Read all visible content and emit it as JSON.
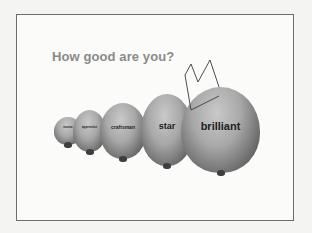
{
  "slide": {
    "title": "How good are you?",
    "levels": [
      {
        "label": "novice"
      },
      {
        "label": "apprentice"
      },
      {
        "label": "craftsman"
      },
      {
        "label": "star"
      },
      {
        "label": "brilliant"
      }
    ],
    "crown_on": "brilliant"
  },
  "colors": {
    "title": "#8a8a8a",
    "frame": "#6e6e6e",
    "lemon_light": "#c9c9c9",
    "lemon_dark": "#3e3e3e"
  }
}
